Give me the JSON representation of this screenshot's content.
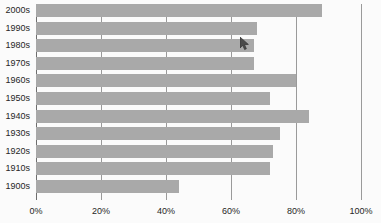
{
  "chart_data": {
    "type": "bar",
    "orientation": "horizontal",
    "title": "",
    "subtitle": "",
    "xlabel": "",
    "ylabel": "",
    "categories": [
      "2000s",
      "1990s",
      "1980s",
      "1970s",
      "1960s",
      "1950s",
      "1940s",
      "1930s",
      "1920s",
      "1910s",
      "1900s"
    ],
    "values": [
      88,
      68,
      67,
      67,
      80,
      72,
      84,
      75,
      73,
      72,
      44
    ],
    "value_suffix": "%",
    "xlim": [
      0,
      100
    ],
    "xticks": [
      0,
      20,
      40,
      60,
      80,
      100
    ],
    "xticklabels": [
      "0%",
      "20%",
      "40%",
      "60%",
      "80%",
      "100%"
    ],
    "grid": "vertical",
    "legend": "none",
    "bar_color": "#a9a9a9",
    "gridline_color": "#9a9a9a",
    "axis_color": "#6e6e6e",
    "background_color": "#fbfbfb",
    "text_color": "#262626",
    "annotations": []
  },
  "cursor": {
    "name": "mouse-pointer",
    "visible": true,
    "x": 240,
    "y": 37
  }
}
